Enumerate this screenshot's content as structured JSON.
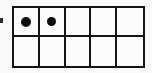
{
  "image": {
    "title": "Ten Frame",
    "width": 152,
    "height": 73,
    "background_color": "#fafafa"
  },
  "chart_data": {
    "type": "table",
    "rows": 2,
    "columns": 5,
    "total_cells": 10,
    "filled_count": 2,
    "empty_count": 8,
    "filled_positions": [
      {
        "row": 1,
        "column": 1
      },
      {
        "row": 1,
        "column": 2
      }
    ],
    "cells": [
      {
        "row": 1,
        "column": 1,
        "filled": true,
        "marker": "dot"
      },
      {
        "row": 1,
        "column": 2,
        "filled": true,
        "marker": "dot"
      },
      {
        "row": 1,
        "column": 3,
        "filled": false,
        "marker": ""
      },
      {
        "row": 1,
        "column": 4,
        "filled": false,
        "marker": ""
      },
      {
        "row": 1,
        "column": 5,
        "filled": false,
        "marker": ""
      },
      {
        "row": 2,
        "column": 1,
        "filled": false,
        "marker": ""
      },
      {
        "row": 2,
        "column": 2,
        "filled": false,
        "marker": ""
      },
      {
        "row": 2,
        "column": 3,
        "filled": false,
        "marker": ""
      },
      {
        "row": 2,
        "column": 4,
        "filled": false,
        "marker": ""
      },
      {
        "row": 2,
        "column": 5,
        "filled": false,
        "marker": ""
      }
    ],
    "grid": true,
    "line_color": "#151515",
    "dot_color": "#0a0a0a",
    "fill_color": "#fcfcfc"
  },
  "artifacts": {
    "edge_speck": {
      "name": "scan-speck",
      "color": "#2a2a2a"
    }
  }
}
